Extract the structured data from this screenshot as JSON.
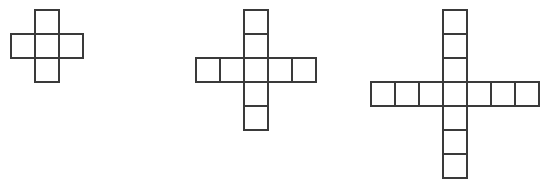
{
  "canvas": {
    "width": 542,
    "height": 179,
    "background": "#ffffff"
  },
  "style": {
    "stroke_color": "#3a3a3a",
    "stroke_width": 1.6,
    "fill_color": "#ffffff",
    "cell_size": 24
  },
  "figures": [
    {
      "name": "cross-figure-1",
      "arm_length": 1,
      "square_count": 5,
      "grid_span": 3,
      "center_cell_x": 47,
      "center_cell_y": 46,
      "cells": [
        {
          "col": 0,
          "row": -1
        },
        {
          "col": -1,
          "row": 0
        },
        {
          "col": 0,
          "row": 0
        },
        {
          "col": 1,
          "row": 0
        },
        {
          "col": 0,
          "row": 1
        }
      ]
    },
    {
      "name": "cross-figure-2",
      "arm_length": 2,
      "square_count": 9,
      "grid_span": 5,
      "center_cell_x": 256,
      "center_cell_y": 70,
      "cells": [
        {
          "col": 0,
          "row": -2
        },
        {
          "col": 0,
          "row": -1
        },
        {
          "col": -2,
          "row": 0
        },
        {
          "col": -1,
          "row": 0
        },
        {
          "col": 0,
          "row": 0
        },
        {
          "col": 1,
          "row": 0
        },
        {
          "col": 2,
          "row": 0
        },
        {
          "col": 0,
          "row": 1
        },
        {
          "col": 0,
          "row": 2
        }
      ]
    },
    {
      "name": "cross-figure-3",
      "arm_length": 3,
      "square_count": 13,
      "grid_span": 7,
      "center_cell_x": 455,
      "center_cell_y": 94,
      "cells": [
        {
          "col": 0,
          "row": -3
        },
        {
          "col": 0,
          "row": -2
        },
        {
          "col": 0,
          "row": -1
        },
        {
          "col": -3,
          "row": 0
        },
        {
          "col": -2,
          "row": 0
        },
        {
          "col": -1,
          "row": 0
        },
        {
          "col": 0,
          "row": 0
        },
        {
          "col": 1,
          "row": 0
        },
        {
          "col": 2,
          "row": 0
        },
        {
          "col": 3,
          "row": 0
        },
        {
          "col": 0,
          "row": 1
        },
        {
          "col": 0,
          "row": 2
        },
        {
          "col": 0,
          "row": 3
        }
      ]
    }
  ]
}
